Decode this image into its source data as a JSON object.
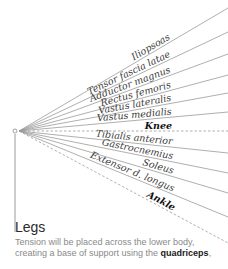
{
  "diagram": {
    "origin": {
      "x": 19,
      "y": 131
    },
    "colors": {
      "line": "#9a9a9a",
      "joint_line": "#9a9a9a",
      "label": "#3a3a3a",
      "joint_label": "#111111"
    },
    "rays": [
      {
        "label": "Iliopsoas",
        "end_y": 8,
        "kind": "muscle"
      },
      {
        "label": "Tensor fascia latae",
        "end_y": 32,
        "kind": "muscle"
      },
      {
        "label": "Adductor magnus",
        "end_y": 54,
        "kind": "muscle"
      },
      {
        "label": "Rectus femoris",
        "end_y": 75,
        "kind": "muscle"
      },
      {
        "label": "Vastus lateralis",
        "end_y": 93,
        "kind": "muscle"
      },
      {
        "label": "Vastus medialis",
        "end_y": 112,
        "kind": "muscle"
      },
      {
        "label": "Knee",
        "end_y": 131,
        "kind": "joint"
      },
      {
        "label": "Tibialis anterior",
        "end_y": 153,
        "kind": "muscle"
      },
      {
        "label": "Gastrocnemius",
        "end_y": 173,
        "kind": "muscle"
      },
      {
        "label": "Soleus",
        "end_y": 193,
        "kind": "muscle"
      },
      {
        "label": "Extensor d. longus",
        "end_y": 217,
        "kind": "muscle"
      },
      {
        "label": "Ankle",
        "end_y": 243,
        "kind": "joint"
      }
    ]
  },
  "section": {
    "title": "Legs",
    "description_prefix": "Tension will be placed across the lower body, creating a base of support using the ",
    "description_emphasis": "quadriceps",
    "description_suffix": ","
  }
}
